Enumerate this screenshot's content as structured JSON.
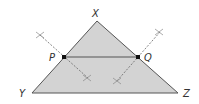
{
  "diagram": {
    "colors": {
      "fill": "#d3d3d3",
      "stroke": "#555555",
      "point": "#111111",
      "construction": "#666666",
      "label": "#333333"
    },
    "vertices": {
      "X": {
        "label": "X",
        "x": 97,
        "y": 21
      },
      "Y": {
        "label": "Y",
        "x": 32,
        "y": 93
      },
      "Z": {
        "label": "Z",
        "x": 178,
        "y": 93
      }
    },
    "points": {
      "P": {
        "label": "P",
        "x": 64,
        "y": 57
      },
      "Q": {
        "label": "Q",
        "x": 138,
        "y": 57
      }
    },
    "segments": [
      {
        "from": "X",
        "to": "Y",
        "name": "side-XY"
      },
      {
        "from": "Y",
        "to": "Z",
        "name": "side-YZ"
      },
      {
        "from": "Z",
        "to": "X",
        "name": "side-ZX"
      },
      {
        "from": "P",
        "to": "Q",
        "name": "midsegment-PQ"
      }
    ],
    "construction_lines": [
      {
        "name": "bisector-XY",
        "x1": 40,
        "y1": 35,
        "x2": 88,
        "y2": 78
      },
      {
        "name": "bisector-XZ",
        "x1": 160,
        "y1": 32,
        "x2": 116,
        "y2": 82
      }
    ],
    "arc_marks": [
      {
        "name": "arc-mark-xy-top",
        "x": 40,
        "y": 35
      },
      {
        "name": "arc-mark-xy-bottom",
        "x": 87,
        "y": 78
      },
      {
        "name": "arc-mark-xz-top",
        "x": 159,
        "y": 32
      },
      {
        "name": "arc-mark-xz-bottom",
        "x": 117,
        "y": 81
      }
    ]
  }
}
